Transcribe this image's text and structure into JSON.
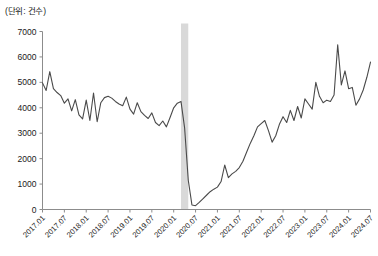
{
  "unit_label": "(단위: 건수)",
  "colors": {
    "line": "#4a4a4a",
    "axis": "#8c8c8c",
    "band": "#d9d9d9",
    "text": "#1a1a1a"
  },
  "chart_data": {
    "type": "line",
    "title": "",
    "subtitle": "",
    "xlabel": "",
    "ylabel": "",
    "unit": "(단위: 건수)",
    "grid": false,
    "legend": null,
    "ylim": [
      0,
      7000
    ],
    "ytick_labels": [
      "0",
      "1000",
      "2000",
      "3000",
      "4000",
      "5000",
      "6000",
      "7000"
    ],
    "ytick_values": [
      0,
      1000,
      2000,
      3000,
      4000,
      5000,
      6000,
      7000
    ],
    "xtick_labels": [
      "2017.01",
      "2017.07",
      "2018.01",
      "2018.07",
      "2019.01",
      "2019.07",
      "2020.01",
      "2020.07",
      "2021.01",
      "2021.07",
      "2022.01",
      "2022.07",
      "2023.01",
      "2023.07",
      "2024.01",
      "2024.07"
    ],
    "xtick_x": [
      "2017.01",
      "2017.07",
      "2018.01",
      "2018.07",
      "2019.01",
      "2019.07",
      "2020.01",
      "2020.07",
      "2021.01",
      "2021.07",
      "2022.01",
      "2022.07",
      "2023.01",
      "2023.07",
      "2024.01",
      "2024.07"
    ],
    "xlim": [
      "2017.01",
      "2024.07"
    ],
    "annotations": [
      {
        "type": "vertical-band",
        "label": "covid-shock-band",
        "x_start": "2020.03",
        "x_end": "2020.05",
        "color": "#d9d9d9"
      }
    ],
    "series": [
      {
        "name": "건수",
        "color": "#4a4a4a",
        "x": [
          "2017.01",
          "2017.02",
          "2017.03",
          "2017.04",
          "2017.05",
          "2017.06",
          "2017.07",
          "2017.08",
          "2017.09",
          "2017.10",
          "2017.11",
          "2017.12",
          "2018.01",
          "2018.02",
          "2018.03",
          "2018.04",
          "2018.05",
          "2018.06",
          "2018.07",
          "2018.08",
          "2018.09",
          "2018.10",
          "2018.11",
          "2018.12",
          "2019.01",
          "2019.02",
          "2019.03",
          "2019.04",
          "2019.05",
          "2019.06",
          "2019.07",
          "2019.08",
          "2019.09",
          "2019.10",
          "2019.11",
          "2019.12",
          "2020.01",
          "2020.02",
          "2020.03",
          "2020.04",
          "2020.05",
          "2020.06",
          "2020.07",
          "2020.08",
          "2020.09",
          "2020.10",
          "2020.11",
          "2020.12",
          "2021.01",
          "2021.02",
          "2021.03",
          "2021.04",
          "2021.05",
          "2021.06",
          "2021.07",
          "2021.08",
          "2021.09",
          "2021.10",
          "2021.11",
          "2021.12",
          "2022.01",
          "2022.02",
          "2022.03",
          "2022.04",
          "2022.05",
          "2022.06",
          "2022.07",
          "2022.08",
          "2022.09",
          "2022.10",
          "2022.11",
          "2022.12",
          "2023.01",
          "2023.02",
          "2023.03",
          "2023.04",
          "2023.05",
          "2023.06",
          "2023.07",
          "2023.08",
          "2023.09",
          "2023.10",
          "2023.11",
          "2023.12",
          "2024.01",
          "2024.02",
          "2024.03",
          "2024.04",
          "2024.05",
          "2024.06",
          "2024.07"
        ],
        "values": [
          4980,
          4680,
          5420,
          4750,
          4600,
          4480,
          4180,
          4350,
          3880,
          4320,
          3720,
          3560,
          4300,
          3500,
          4580,
          3450,
          4200,
          4400,
          4450,
          4380,
          4250,
          4150,
          4080,
          4420,
          3950,
          3750,
          4200,
          3850,
          3700,
          3580,
          3800,
          3420,
          3300,
          3480,
          3250,
          3620,
          4000,
          4180,
          4250,
          3200,
          1150,
          180,
          150,
          280,
          420,
          560,
          700,
          800,
          880,
          1100,
          1750,
          1250,
          1400,
          1500,
          1650,
          1900,
          2250,
          2600,
          2900,
          3250,
          3380,
          3500,
          3100,
          2650,
          2900,
          3350,
          3650,
          3420,
          3900,
          3500,
          4050,
          3600,
          4350,
          4150,
          3950,
          5000,
          4450,
          4200,
          4300,
          4250,
          4500,
          6480,
          4900,
          5450,
          4750,
          4800,
          4100,
          4350,
          4700,
          5200,
          5800
        ]
      }
    ]
  }
}
